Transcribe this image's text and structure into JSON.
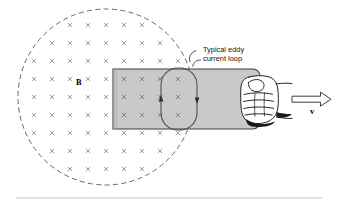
{
  "figure": {
    "background_color": "#ffffff",
    "width": 338,
    "height": 204
  },
  "field_region": {
    "name": "magnetic-field-region",
    "shape": "circle",
    "boundary_style": "dashed",
    "boundary_color": "#555555",
    "center_x": 106,
    "center_y": 97,
    "radius": 88,
    "marker_symbol": "×",
    "marker_meaning": "field into page",
    "marker_color": "#8d8d8d",
    "marker_spacing_x": 18,
    "marker_spacing_y": 18,
    "label": "B",
    "label_x": 78,
    "label_y": 84
  },
  "plate": {
    "name": "metal-plate",
    "x": 113,
    "y": 69,
    "width": 147,
    "height": 60,
    "fill_color": "#c9c9c9",
    "stroke_color": "#3c3c3c",
    "corner_radius_right": 7
  },
  "eddy_loop": {
    "name": "eddy-current-loop",
    "shape": "stadium",
    "center_x": 179,
    "center_y": 99,
    "width": 36,
    "height": 62,
    "stroke_color": "#4a4a4a",
    "circulation": "counterclockwise",
    "arrow_left_direction": "up",
    "arrow_right_direction": "down"
  },
  "callout": {
    "name": "eddy-loop-callout",
    "line1": "Typical eddy",
    "line2": "current loop",
    "text_x": 203,
    "text_y": 52,
    "leader_color": "#2b2b2b"
  },
  "hand": {
    "name": "hand-gripping-plate",
    "description": "fist gripping right edge of plate",
    "x": 239,
    "y": 74,
    "width": 42,
    "height": 50,
    "fill_color": "#ffffff",
    "stroke_color": "#1a1a1a"
  },
  "velocity": {
    "name": "velocity-vector",
    "label": "v",
    "arrow_style": "hollow-outline",
    "direction": "right",
    "start_x": 292,
    "end_x": 331,
    "y": 99,
    "label_x": 313,
    "label_y": 111,
    "stroke_color": "#333333"
  },
  "footer_rule": {
    "name": "footer-divider",
    "x1": 16,
    "x2": 322,
    "y": 198,
    "color": "#b9b9b9"
  }
}
